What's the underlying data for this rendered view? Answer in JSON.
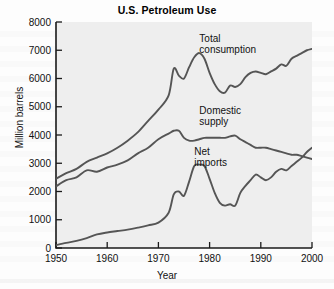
{
  "figure": {
    "title": "U.S. Petroleum Use"
  },
  "chart_data": {
    "type": "line",
    "title": "U.S. Petroleum Use",
    "xlabel": "Year",
    "ylabel": "Million barrels",
    "xlim": [
      1950,
      2000
    ],
    "ylim": [
      0,
      8000
    ],
    "xticks": [
      "1950",
      "1960",
      "1970",
      "1980",
      "1990",
      "2000"
    ],
    "yticks": [
      "0",
      "1000",
      "2000",
      "3000",
      "4000",
      "5000",
      "6000",
      "7000",
      "8000"
    ],
    "grid": false,
    "legend_position": "inline-annotations",
    "line_color": "#555555",
    "plot_background": "#eeeeee",
    "series": [
      {
        "name": "Total consumption",
        "label_x": 1978,
        "label_y": 7300,
        "x": [
          1950,
          1952,
          1954,
          1956,
          1958,
          1960,
          1962,
          1964,
          1966,
          1968,
          1970,
          1972,
          1973,
          1974,
          1975,
          1976,
          1977,
          1978,
          1979,
          1980,
          1981,
          1982,
          1983,
          1984,
          1985,
          1986,
          1987,
          1988,
          1989,
          1990,
          1991,
          1992,
          1993,
          1994,
          1995,
          1996,
          1997,
          1998,
          1999,
          2000
        ],
        "values": [
          2450,
          2650,
          2800,
          3050,
          3200,
          3350,
          3550,
          3800,
          4100,
          4500,
          4900,
          5400,
          6350,
          6100,
          6000,
          6400,
          6750,
          6900,
          6700,
          6200,
          5800,
          5550,
          5500,
          5750,
          5700,
          5800,
          6050,
          6200,
          6250,
          6200,
          6150,
          6250,
          6350,
          6500,
          6450,
          6700,
          6800,
          6900,
          7000,
          7050
        ],
        "annotations": [
          {
            "year": 1973,
            "value": 6350,
            "note": "first oil-crisis peak"
          },
          {
            "year": 1978,
            "value": 6900,
            "note": "all-time peak"
          },
          {
            "year": 1983,
            "value": 5500,
            "note": "recession trough"
          }
        ]
      },
      {
        "name": "Domestic supply",
        "label_x": 1978,
        "label_y": 4750,
        "x": [
          1950,
          1952,
          1954,
          1956,
          1958,
          1960,
          1962,
          1964,
          1966,
          1968,
          1970,
          1972,
          1973,
          1974,
          1975,
          1976,
          1977,
          1978,
          1979,
          1980,
          1981,
          1982,
          1983,
          1984,
          1985,
          1986,
          1987,
          1988,
          1989,
          1990,
          1991,
          1992,
          1993,
          1994,
          1995,
          1996,
          1997,
          1998,
          1999,
          2000
        ],
        "values": [
          2180,
          2400,
          2500,
          2750,
          2700,
          2850,
          2950,
          3100,
          3350,
          3550,
          3850,
          4050,
          4150,
          4150,
          3900,
          3800,
          3800,
          3850,
          3900,
          3900,
          3900,
          3900,
          3900,
          3950,
          3980,
          3850,
          3750,
          3650,
          3550,
          3550,
          3550,
          3500,
          3450,
          3400,
          3350,
          3300,
          3300,
          3250,
          3200,
          3150
        ]
      },
      {
        "name": "Net imports",
        "label_x": 1977,
        "label_y": 3300,
        "x": [
          1950,
          1952,
          1954,
          1956,
          1958,
          1960,
          1962,
          1964,
          1966,
          1968,
          1970,
          1972,
          1973,
          1974,
          1975,
          1976,
          1977,
          1978,
          1979,
          1980,
          1981,
          1982,
          1983,
          1984,
          1985,
          1986,
          1987,
          1988,
          1989,
          1990,
          1991,
          1992,
          1993,
          1994,
          1995,
          1996,
          1997,
          1998,
          1999,
          2000
        ],
        "values": [
          100,
          180,
          250,
          350,
          480,
          550,
          600,
          650,
          720,
          800,
          900,
          1250,
          1900,
          2000,
          1850,
          2350,
          2900,
          2950,
          2900,
          2450,
          1950,
          1600,
          1500,
          1550,
          1500,
          1950,
          2200,
          2400,
          2600,
          2500,
          2400,
          2500,
          2700,
          2800,
          2750,
          2900,
          3050,
          3200,
          3400,
          3550
        ],
        "annotations": [
          {
            "year": 1977,
            "value": 2950,
            "note": "import peak"
          },
          {
            "year": 1983,
            "value": 1500,
            "note": "import trough"
          },
          {
            "year": 1998,
            "value": 3200,
            "note": "crosses domestic supply"
          }
        ]
      }
    ]
  }
}
